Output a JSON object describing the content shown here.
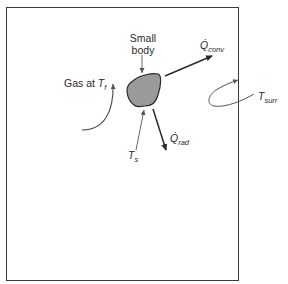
{
  "diagram": {
    "type": "heat-transfer-schematic",
    "labels": {
      "small_body_line1": "Small",
      "small_body_line2": "body",
      "gas": "Gas at ",
      "gas_temp_symbol": "T",
      "gas_temp_sub": "f",
      "surface_temp_symbol": "T",
      "surface_temp_sub": "s",
      "surroundings_temp_symbol": "T",
      "surroundings_temp_sub": "surr",
      "q_conv_symbol": "Q̇",
      "q_conv_sub": "conv",
      "q_rad_symbol": "Q̇",
      "q_rad_sub": "rad"
    },
    "colors": {
      "body_fill": "#9a9a9a",
      "stroke": "#2a2a2a",
      "thin_stroke": "#555555",
      "border": "#3a3a3a"
    }
  }
}
